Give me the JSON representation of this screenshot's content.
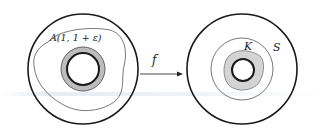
{
  "diagram": {
    "left_figure": {
      "region_label": "A(1, 1 + ε)",
      "description": "Annulus domain with inner circle, shaded thin annulus A(1,1+ε), and irregular closed curve"
    },
    "map": {
      "label": "f",
      "arrow": "right"
    },
    "right_figure": {
      "compact_label": "K",
      "curve_label": "S",
      "description": "Image annulus with shaded compact set K around inner circle, enclosed by circle S"
    },
    "colors": {
      "stroke": "#1a1a1a",
      "thin_stroke": "#555555",
      "shade": "#d4d4d4"
    }
  }
}
